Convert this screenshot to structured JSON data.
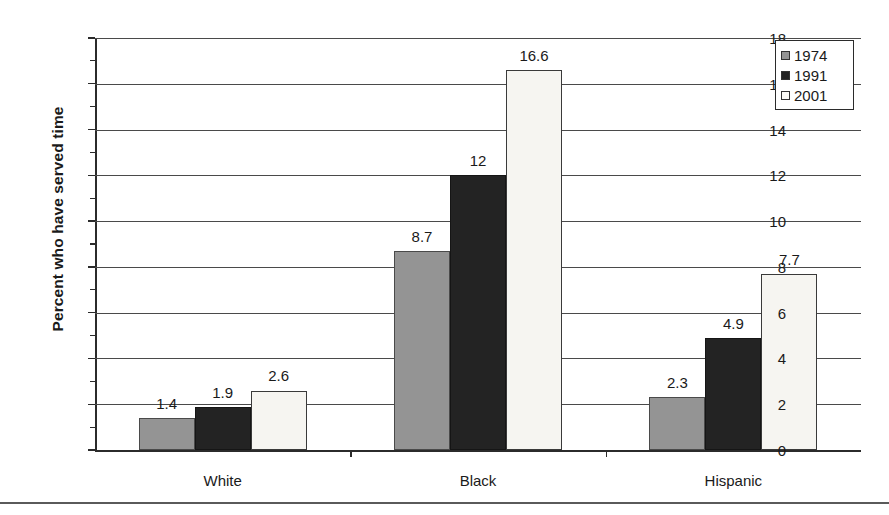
{
  "chart_data": {
    "type": "bar",
    "title": "",
    "subtitle": "",
    "xlabel": "",
    "ylabel": "Percent who have served time",
    "ylim": [
      0,
      18
    ],
    "ytick_step": 2,
    "yticks": [
      0,
      2,
      4,
      6,
      8,
      10,
      12,
      14,
      16,
      18
    ],
    "ytick_labels": [
      "0",
      "2",
      "4",
      "6",
      "8",
      "10",
      "12",
      "14",
      "16",
      "18"
    ],
    "minor_yticks": [
      1,
      3,
      5,
      7,
      9,
      11,
      13,
      15,
      17
    ],
    "grid": "horizontal",
    "legend_position": "top-right",
    "categories": [
      "White",
      "Black",
      "Hispanic"
    ],
    "series": [
      {
        "name": "1974",
        "color": "#949494",
        "values": [
          1.4,
          8.7,
          2.3
        ],
        "value_labels": [
          "1.4",
          "8.7",
          "2.3"
        ]
      },
      {
        "name": "1991",
        "color": "#232323",
        "values": [
          1.9,
          12.0,
          4.9
        ],
        "value_labels": [
          "1.9",
          "12",
          "4.9"
        ]
      },
      {
        "name": "2001",
        "color": "#f6f5f1",
        "values": [
          2.6,
          16.6,
          7.7
        ],
        "value_labels": [
          "2.6",
          "16.6",
          "7.7"
        ]
      }
    ]
  },
  "legend": {
    "entries": [
      {
        "label": "1974",
        "swatch": "legend-swatch-1974"
      },
      {
        "label": "1991",
        "swatch": "legend-swatch-1991"
      },
      {
        "label": "2001",
        "swatch": "legend-swatch-2001"
      }
    ]
  }
}
